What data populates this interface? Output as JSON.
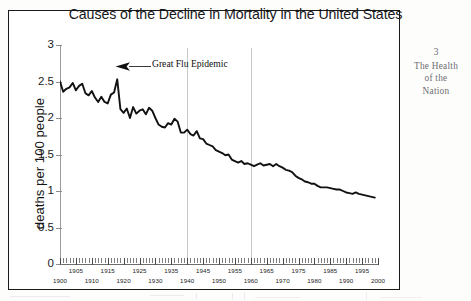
{
  "running_head": {
    "chapter_number": "3",
    "line1": "The Health",
    "line2": "of the",
    "line3": "Nation"
  },
  "annotation": {
    "text": "Great Flu Epidemic",
    "arrow_icon": "arrow-left-icon"
  },
  "colors": {
    "line": "#111111",
    "axis": "#8d8d8d",
    "grid": "#c9c9c9",
    "frame": "#1a1a1a",
    "running_head": "#6d6d72"
  },
  "chart_data": {
    "type": "line",
    "title": "Causes of the Decline in Mortality in the United States",
    "xlabel": "",
    "ylabel": "deaths per 100 people",
    "xlim": [
      1900,
      2000
    ],
    "ylim": [
      0,
      3
    ],
    "yticks": [
      "0",
      "0.5",
      "1",
      "1.5",
      "2",
      "2.5",
      "3"
    ],
    "ytick_values": [
      0,
      0.5,
      1,
      1.5,
      2,
      2.5,
      3
    ],
    "xticks_upper": [
      "1905",
      "1915",
      "1925",
      "1935",
      "1945",
      "1955",
      "1965",
      "1975",
      "1985",
      "1995"
    ],
    "xticks_lower": [
      "1900",
      "1910",
      "1920",
      "1930",
      "1940",
      "1950",
      "1960",
      "1970",
      "1980",
      "1990",
      "2000"
    ],
    "xtick_upper_values": [
      1905,
      1915,
      1925,
      1935,
      1945,
      1955,
      1965,
      1975,
      1985,
      1995
    ],
    "xtick_lower_values": [
      1900,
      1910,
      1920,
      1930,
      1940,
      1950,
      1960,
      1970,
      1980,
      1990,
      2000
    ],
    "minor_tick_interval": 1,
    "grid": false,
    "reference_lines_x": [
      1940,
      1960
    ],
    "legend": null,
    "annotations": [
      {
        "text": "Great Flu Epidemic",
        "x": 1918,
        "y": 2.53
      }
    ],
    "series": [
      {
        "name": "deaths per 100 people",
        "x": [
          1900,
          1901,
          1902,
          1903,
          1904,
          1905,
          1906,
          1907,
          1908,
          1909,
          1910,
          1911,
          1912,
          1913,
          1914,
          1915,
          1916,
          1917,
          1918,
          1919,
          1920,
          1921,
          1922,
          1923,
          1924,
          1925,
          1926,
          1927,
          1928,
          1929,
          1930,
          1931,
          1932,
          1933,
          1934,
          1935,
          1936,
          1937,
          1938,
          1939,
          1940,
          1941,
          1942,
          1943,
          1944,
          1945,
          1946,
          1947,
          1948,
          1949,
          1950,
          1951,
          1952,
          1953,
          1954,
          1955,
          1956,
          1957,
          1958,
          1959,
          1960,
          1961,
          1962,
          1963,
          1964,
          1965,
          1966,
          1967,
          1968,
          1969,
          1970,
          1971,
          1972,
          1973,
          1974,
          1975,
          1976,
          1977,
          1978,
          1979,
          1980,
          1981,
          1982,
          1983,
          1984,
          1985,
          1986,
          1987,
          1988,
          1989,
          1990,
          1991,
          1992,
          1993,
          1994,
          1995,
          1996,
          1997,
          1998,
          1999
        ],
        "values": [
          2.5,
          2.36,
          2.4,
          2.42,
          2.48,
          2.38,
          2.44,
          2.47,
          2.34,
          2.31,
          2.37,
          2.28,
          2.22,
          2.29,
          2.22,
          2.2,
          2.32,
          2.35,
          2.53,
          2.12,
          2.07,
          2.13,
          2.0,
          2.15,
          2.06,
          2.1,
          2.12,
          2.05,
          2.14,
          2.1,
          2.0,
          1.91,
          1.88,
          1.87,
          1.93,
          1.91,
          1.99,
          1.95,
          1.8,
          1.8,
          1.84,
          1.78,
          1.76,
          1.82,
          1.72,
          1.71,
          1.65,
          1.63,
          1.61,
          1.56,
          1.54,
          1.52,
          1.49,
          1.5,
          1.43,
          1.41,
          1.39,
          1.41,
          1.37,
          1.38,
          1.36,
          1.34,
          1.36,
          1.38,
          1.35,
          1.36,
          1.37,
          1.34,
          1.37,
          1.34,
          1.32,
          1.29,
          1.28,
          1.26,
          1.21,
          1.18,
          1.16,
          1.13,
          1.12,
          1.1,
          1.1,
          1.07,
          1.05,
          1.05,
          1.05,
          1.04,
          1.03,
          1.02,
          1.02,
          1.0,
          0.98,
          0.97,
          0.96,
          0.98,
          0.96,
          0.95,
          0.94,
          0.93,
          0.92,
          0.91
        ]
      }
    ]
  }
}
